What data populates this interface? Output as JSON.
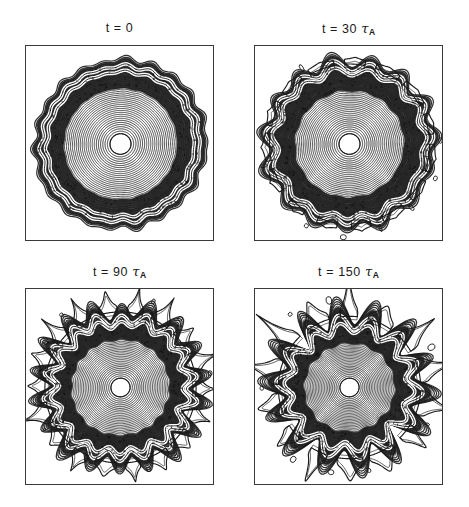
{
  "figure": {
    "background_color": "#ffffff",
    "ink_color": "#1a1a1a",
    "frame_color": "#3a3a3a",
    "width": 469,
    "height": 507,
    "panel_count": 4,
    "layout": "2x2"
  },
  "panels": [
    {
      "id": "panel-t0",
      "title_prefix": "t = ",
      "title_value": "0",
      "title_unit": "",
      "title_unit_sub": "",
      "title_full": "t = 0",
      "frame": {
        "x": 25,
        "y": 45,
        "w": 189,
        "h": 196
      },
      "title_pos": {
        "x": 25,
        "y": 22,
        "w": 189
      }
    },
    {
      "id": "panel-t30",
      "title_prefix": "t = ",
      "title_value": "30",
      "title_unit": "τ",
      "title_unit_sub": "A",
      "title_full": "t = 30 τA",
      "frame": {
        "x": 254,
        "y": 45,
        "w": 189,
        "h": 196
      },
      "title_pos": {
        "x": 254,
        "y": 22,
        "w": 189
      }
    },
    {
      "id": "panel-t90",
      "title_prefix": "t = ",
      "title_value": "90",
      "title_unit": "τ",
      "title_unit_sub": "A",
      "title_full": "t = 90 τA",
      "frame": {
        "x": 25,
        "y": 288,
        "w": 189,
        "h": 197
      },
      "title_pos": {
        "x": 25,
        "y": 265,
        "w": 189
      }
    },
    {
      "id": "panel-t150",
      "title_prefix": "t = ",
      "title_value": "150",
      "title_unit": "τ",
      "title_unit_sub": "A",
      "title_full": "t = 150 τA",
      "frame": {
        "x": 254,
        "y": 288,
        "w": 189,
        "h": 197
      },
      "title_pos": {
        "x": 254,
        "y": 265,
        "w": 189
      }
    }
  ],
  "chart_data": {
    "type": "contour",
    "title": "",
    "subtitle": "",
    "xlabel": "",
    "ylabel": "",
    "grid": false,
    "legend": "none",
    "axis_ticks": "none",
    "time_unit": "Alfven time (tau_A)",
    "times": [
      0,
      30,
      90,
      150
    ],
    "time_labels": [
      "t = 0",
      "t = 30 τA",
      "t = 90 τA",
      "t = 150 τA"
    ],
    "panels": [
      {
        "name": "t = 0",
        "time": 0,
        "center": [
          0.5,
          0.5
        ],
        "mean_outer_radius": 0.455,
        "mode_number": 22,
        "perturbation_amplitude": 0.01,
        "finger_amplitude": 0.0,
        "n_contours": 40,
        "inner_core_radius": 0.055,
        "dark_annulus": [
          0.3,
          0.44
        ],
        "white_gap_radii": [
          0.415,
          0.385
        ],
        "roughness": 0.012,
        "state": "smooth circular contours, essentially unperturbed"
      },
      {
        "name": "t = 30 tau_A",
        "time": 30,
        "center": [
          0.5,
          0.5
        ],
        "mean_outer_radius": 0.455,
        "mode_number": 15,
        "perturbation_amplitude": 0.03,
        "finger_amplitude": 0.01,
        "n_contours": 42,
        "inner_core_radius": 0.055,
        "dark_annulus": [
          0.29,
          0.44
        ],
        "white_gap_radii": [
          0.42,
          0.39
        ],
        "roughness": 0.014,
        "state": "regular sinusoidal corrugation of the outer contours, ~15 lobes"
      },
      {
        "name": "t = 90 tau_A",
        "time": 90,
        "center": [
          0.5,
          0.5
        ],
        "mean_outer_radius": 0.43,
        "mode_number": 18,
        "perturbation_amplitude": 0.055,
        "finger_amplitude": 0.055,
        "n_contours": 44,
        "inner_core_radius": 0.05,
        "dark_annulus": [
          0.26,
          0.4
        ],
        "white_gap_radii": [
          0.375,
          0.345
        ],
        "roughness": 0.018,
        "state": "nonlinear mushroom-shaped fingers protruding from the boundary"
      },
      {
        "name": "t = 150 tau_A",
        "time": 150,
        "center": [
          0.5,
          0.5
        ],
        "mean_outer_radius": 0.405,
        "mode_number": 14,
        "perturbation_amplitude": 0.08,
        "finger_amplitude": 0.095,
        "n_contours": 46,
        "inner_core_radius": 0.05,
        "dark_annulus": [
          0.24,
          0.37
        ],
        "white_gap_radii": [
          0.345,
          0.315
        ],
        "roughness": 0.02,
        "state": "large detached mushroom plumes, strongly distorted outer boundary"
      }
    ]
  }
}
